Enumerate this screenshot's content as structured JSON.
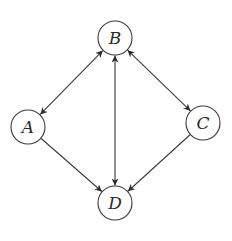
{
  "diagram": {
    "type": "directed-graph",
    "colors": {
      "background": "#ffffff",
      "stroke": "#3a3a3a",
      "text": "#2a2a2a"
    },
    "node_radius": 17,
    "nodes": [
      {
        "id": "A",
        "label": "A",
        "x": 28,
        "y": 127
      },
      {
        "id": "B",
        "label": "B",
        "x": 115,
        "y": 38
      },
      {
        "id": "C",
        "label": "C",
        "x": 203,
        "y": 123
      },
      {
        "id": "D",
        "label": "D",
        "x": 115,
        "y": 203
      }
    ],
    "edges": [
      {
        "from": "A",
        "to": "B",
        "bidirectional": true
      },
      {
        "from": "B",
        "to": "C",
        "bidirectional": true
      },
      {
        "from": "B",
        "to": "D",
        "bidirectional": true
      },
      {
        "from": "A",
        "to": "D",
        "bidirectional": false
      },
      {
        "from": "C",
        "to": "D",
        "bidirectional": false
      }
    ]
  }
}
